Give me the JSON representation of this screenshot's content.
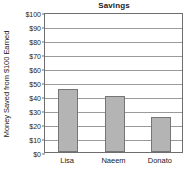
{
  "chart_data": {
    "type": "bar",
    "title": "Savings",
    "xlabel": "",
    "ylabel": "Money Saved from $100 Earned",
    "categories": [
      "Lisa",
      "Naeem",
      "Donato"
    ],
    "values": [
      45,
      40,
      25
    ],
    "ylim": [
      0,
      100
    ],
    "ytick_step": 10,
    "ytick_labels": [
      "$0",
      "$10",
      "$20",
      "$30",
      "$40",
      "$50",
      "$60",
      "$70",
      "$80",
      "$90",
      "$100"
    ],
    "ytick_values": [
      0,
      10,
      20,
      30,
      40,
      50,
      60,
      70,
      80,
      90,
      100
    ],
    "grid": true,
    "legend": false,
    "colors": {
      "bar_fill": "#b4b4b4",
      "bar_edge": "#767676",
      "grid": "#9a9a9a",
      "frame": "#6e6e6e",
      "text": "#1a1a1a",
      "background": "#ffffff"
    }
  }
}
